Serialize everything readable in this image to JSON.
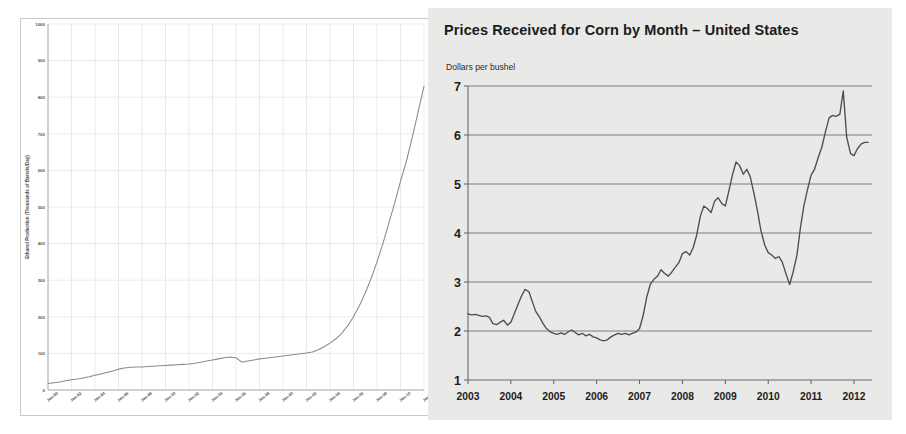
{
  "chart_data": [
    {
      "type": "line",
      "id": "ethanol-production",
      "title": "",
      "xlabel": "",
      "ylabel": "Ethanol Production (Thousands of Barrels/Day)",
      "ylim": [
        0,
        1000
      ],
      "yticks": [
        0,
        100,
        200,
        300,
        400,
        500,
        600,
        700,
        800,
        900,
        1000
      ],
      "xticks": [
        "Jan-80",
        "Jan-82",
        "Jan-84",
        "Jan-86",
        "Jan-88",
        "Jan-90",
        "Jan-92",
        "Jan-94",
        "Jan-96",
        "Jan-98",
        "Jan-00",
        "Jan-02",
        "Jan-04",
        "Jan-06",
        "Jan-08",
        "Jan-10",
        "Jan-12"
      ],
      "xlim": [
        1980,
        2012
      ],
      "grid": true,
      "legend": "none",
      "series": [
        {
          "name": "Ethanol Production",
          "color": "#8a8a8a",
          "x": [
            1980.0,
            1980.5,
            1981.0,
            1981.5,
            1982.0,
            1982.5,
            1983.0,
            1983.5,
            1984.0,
            1984.5,
            1985.0,
            1985.5,
            1986.0,
            1986.5,
            1987.0,
            1987.5,
            1988.0,
            1988.5,
            1989.0,
            1989.5,
            1990.0,
            1990.5,
            1991.0,
            1991.5,
            1992.0,
            1992.5,
            1993.0,
            1993.5,
            1994.0,
            1994.5,
            1995.0,
            1995.5,
            1996.0,
            1996.5,
            1997.0,
            1997.5,
            1998.0,
            1998.5,
            1999.0,
            1999.5,
            2000.0,
            2000.5,
            2001.0,
            2001.5,
            2002.0,
            2002.5,
            2003.0,
            2003.5,
            2004.0,
            2004.5,
            2005.0,
            2005.5,
            2006.0,
            2006.5,
            2007.0,
            2007.5,
            2008.0,
            2008.5,
            2009.0,
            2009.5,
            2010.0,
            2010.5,
            2011.0,
            2011.5,
            2012.0
          ],
          "y": [
            18,
            20,
            22,
            25,
            28,
            30,
            33,
            36,
            40,
            44,
            48,
            52,
            57,
            60,
            62,
            63,
            63,
            64,
            65,
            66,
            67,
            68,
            69,
            70,
            71,
            73,
            76,
            79,
            82,
            85,
            88,
            90,
            88,
            76,
            79,
            82,
            85,
            87,
            89,
            91,
            93,
            95,
            97,
            99,
            101,
            104,
            110,
            118,
            128,
            140,
            155,
            175,
            200,
            230,
            265,
            305,
            350,
            400,
            455,
            510,
            570,
            625,
            690,
            760,
            830,
            900,
            930
          ]
        }
      ]
    },
    {
      "type": "line",
      "id": "corn-prices",
      "title": "Prices Received for Corn by Month – United States",
      "subtitle": "Dollars per bushel",
      "xlabel": "",
      "ylabel": "Dollars per bushel",
      "ylim": [
        1,
        7
      ],
      "yticks": [
        1,
        2,
        3,
        4,
        5,
        6,
        7
      ],
      "xticks": [
        "2003",
        "2004",
        "2005",
        "2006",
        "2007",
        "2008",
        "2009",
        "2010",
        "2011",
        "2012"
      ],
      "xlim": [
        2003,
        2012.42
      ],
      "grid": true,
      "legend": "none",
      "series": [
        {
          "name": "Corn price received",
          "color": "#4d4d4d",
          "x": [
            2003.0,
            2003.08,
            2003.17,
            2003.25,
            2003.33,
            2003.42,
            2003.5,
            2003.58,
            2003.67,
            2003.75,
            2003.83,
            2003.92,
            2004.0,
            2004.08,
            2004.17,
            2004.25,
            2004.33,
            2004.42,
            2004.5,
            2004.58,
            2004.67,
            2004.75,
            2004.83,
            2004.92,
            2005.0,
            2005.08,
            2005.17,
            2005.25,
            2005.33,
            2005.42,
            2005.5,
            2005.58,
            2005.67,
            2005.75,
            2005.83,
            2005.92,
            2006.0,
            2006.08,
            2006.17,
            2006.25,
            2006.33,
            2006.42,
            2006.5,
            2006.58,
            2006.67,
            2006.75,
            2006.83,
            2006.92,
            2007.0,
            2007.08,
            2007.17,
            2007.25,
            2007.33,
            2007.42,
            2007.5,
            2007.58,
            2007.67,
            2007.75,
            2007.83,
            2007.92,
            2008.0,
            2008.08,
            2008.17,
            2008.25,
            2008.33,
            2008.42,
            2008.5,
            2008.58,
            2008.67,
            2008.75,
            2008.83,
            2008.92,
            2009.0,
            2009.08,
            2009.17,
            2009.25,
            2009.33,
            2009.42,
            2009.5,
            2009.58,
            2009.67,
            2009.75,
            2009.83,
            2009.92,
            2010.0,
            2010.08,
            2010.17,
            2010.25,
            2010.33,
            2010.42,
            2010.5,
            2010.58,
            2010.67,
            2010.75,
            2010.83,
            2010.92,
            2011.0,
            2011.08,
            2011.17,
            2011.25,
            2011.33,
            2011.42,
            2011.5,
            2011.58,
            2011.67,
            2011.75,
            2011.83,
            2011.92,
            2012.0,
            2012.08,
            2012.17,
            2012.25,
            2012.33
          ],
          "y": [
            2.35,
            2.33,
            2.34,
            2.32,
            2.3,
            2.31,
            2.28,
            2.15,
            2.13,
            2.18,
            2.22,
            2.12,
            2.18,
            2.35,
            2.55,
            2.72,
            2.85,
            2.8,
            2.6,
            2.4,
            2.28,
            2.15,
            2.05,
            1.98,
            1.95,
            1.93,
            1.96,
            1.93,
            1.98,
            2.02,
            1.97,
            1.92,
            1.95,
            1.9,
            1.93,
            1.88,
            1.86,
            1.82,
            1.8,
            1.82,
            1.88,
            1.92,
            1.95,
            1.93,
            1.95,
            1.92,
            1.95,
            1.98,
            2.05,
            2.3,
            2.7,
            2.95,
            3.05,
            3.12,
            3.25,
            3.18,
            3.12,
            3.2,
            3.3,
            3.4,
            3.58,
            3.62,
            3.55,
            3.7,
            3.95,
            4.35,
            4.55,
            4.5,
            4.42,
            4.65,
            4.72,
            4.6,
            4.55,
            4.85,
            5.2,
            5.45,
            5.38,
            5.2,
            5.3,
            5.15,
            4.8,
            4.45,
            4.05,
            3.75,
            3.6,
            3.55,
            3.48,
            3.52,
            3.4,
            3.15,
            3.05,
            3.18,
            3.12,
            3.02,
            2.98,
            3.02,
            3.1,
            3.08,
            3.25,
            3.3,
            3.2,
            3.12,
            3.05,
            3.02,
            3.08,
            3.15,
            3.08,
            3.05,
            3.1,
            3.15
          ]
        }
      ],
      "series_continued": {
        "note": "full path including 2010-2012 rise and 2011 spike",
        "x": [
          2010.5,
          2010.58,
          2010.67,
          2010.75,
          2010.83,
          2010.92,
          2011.0,
          2011.08,
          2011.17,
          2011.25,
          2011.33,
          2011.42,
          2011.5,
          2011.58,
          2011.67,
          2011.75,
          2011.83,
          2011.92,
          2012.0,
          2012.08,
          2012.17,
          2012.25,
          2012.33
        ],
        "y": [
          2.95,
          3.2,
          3.55,
          4.1,
          4.55,
          4.9,
          5.18,
          5.3,
          5.55,
          5.75,
          6.05,
          6.35,
          6.4,
          6.38,
          6.42,
          6.9,
          5.95,
          5.62,
          5.58,
          5.72,
          5.82,
          5.85,
          5.85
        ]
      }
    }
  ],
  "left_chart": {
    "frame_border_color": "#c9c9c9",
    "grid_color": "#d8d8dd",
    "line_color": "#8a8a8a"
  },
  "right_chart": {
    "background_color": "#e9e9e7",
    "grid_color": "#7d7d7d",
    "line_color": "#4d4d4d",
    "title_color": "#1b1b1b"
  }
}
